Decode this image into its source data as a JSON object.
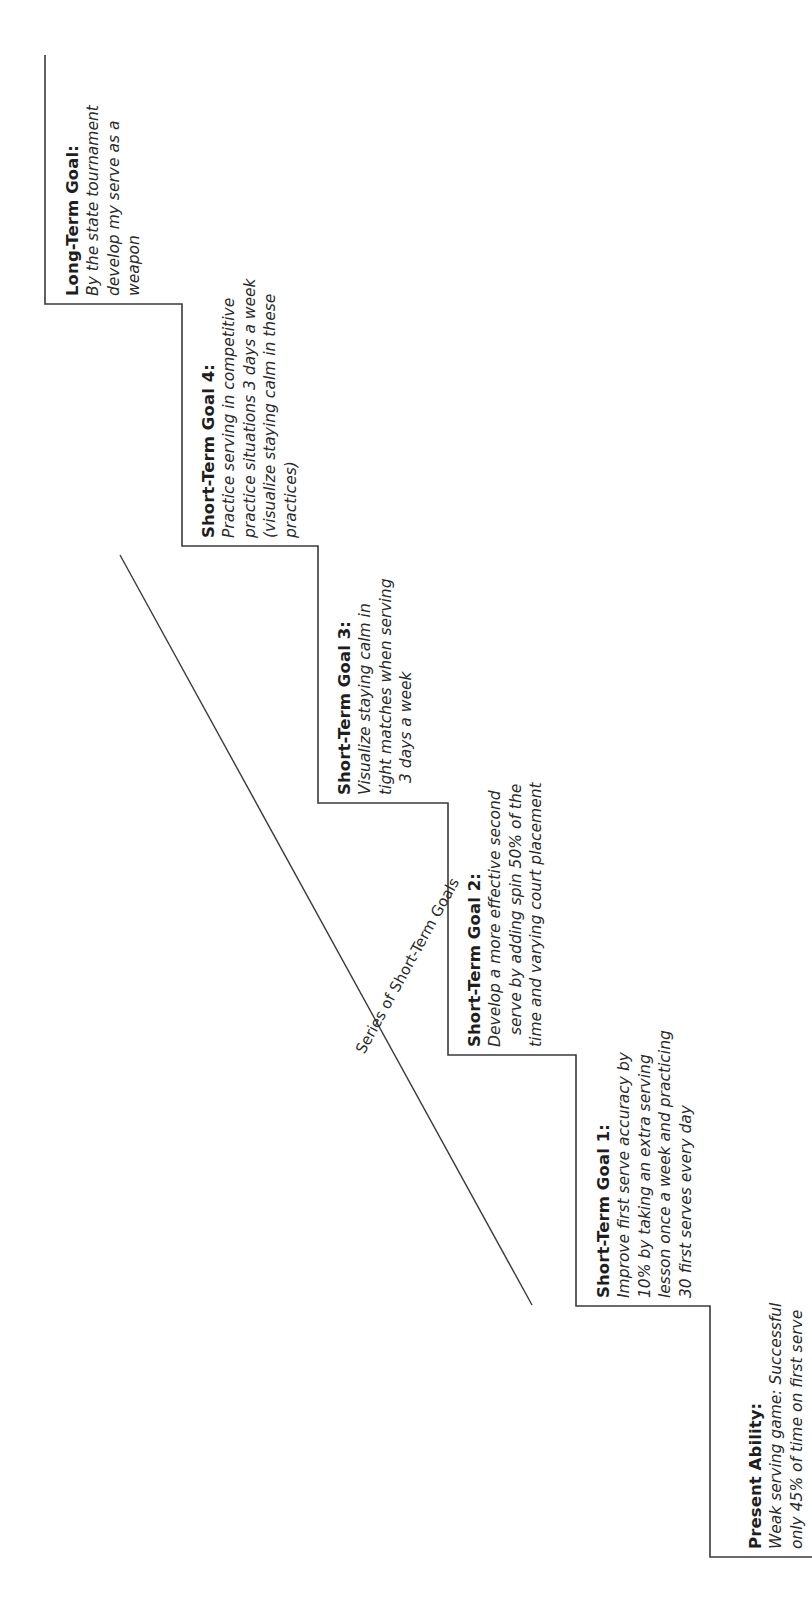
{
  "diagram": {
    "type": "goal-staircase",
    "orientation": "rotated-90-ccw",
    "series_label": "Series of Short-Term Goals",
    "steps": [
      {
        "id": "present",
        "title": "Present Ability:",
        "lines": [
          "Weak serving game: Successful",
          "only 45% of time on first serve"
        ]
      },
      {
        "id": "goal1",
        "title": "Short-Term Goal 1:",
        "lines": [
          "Improve first serve accuracy by",
          "10% by taking an extra serving",
          "lesson once a week and practicing",
          "30 first serves every day"
        ]
      },
      {
        "id": "goal2",
        "title": "Short-Term Goal 2:",
        "lines": [
          "Develop a more effective second",
          "serve by adding spin 50% of the",
          "time and varying court placement"
        ]
      },
      {
        "id": "goal3",
        "title": "Short-Term Goal 3:",
        "lines": [
          "Visualize staying calm in",
          "tight matches when serving",
          "3 days a week"
        ]
      },
      {
        "id": "goal4",
        "title": "Short-Term Goal 4:",
        "lines": [
          "Practice serving in competitive",
          "practice situations 3 days a week",
          "(visualize staying calm in these",
          "practices)"
        ]
      },
      {
        "id": "longterm",
        "title": "Long-Term Goal:",
        "lines": [
          "By the state tournament",
          "develop my serve as a",
          "weapon"
        ]
      }
    ],
    "colors": {
      "line": "#3a3a3a",
      "text": "#1e1e1e",
      "background": "#ffffff"
    }
  }
}
